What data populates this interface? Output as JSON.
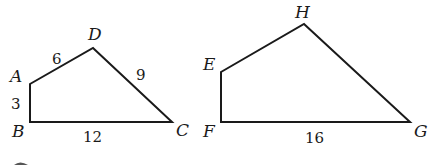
{
  "figures": [
    {
      "name": "quadrilateral-ABCD",
      "vertices": [
        {
          "label": "A",
          "x": 30,
          "y": 84,
          "lx": 10,
          "ly": 82
        },
        {
          "label": "D",
          "x": 93,
          "y": 48,
          "lx": 88,
          "ly": 40
        },
        {
          "label": "C",
          "x": 172,
          "y": 122,
          "lx": 176,
          "ly": 136
        },
        {
          "label": "B",
          "x": 30,
          "y": 122,
          "lx": 12,
          "ly": 137
        }
      ],
      "sides": [
        {
          "name": "AD",
          "label": "6",
          "x": 52,
          "y": 64
        },
        {
          "name": "DC",
          "label": "9",
          "x": 136,
          "y": 80
        },
        {
          "name": "AB",
          "label": "3",
          "x": 11,
          "y": 109
        },
        {
          "name": "BC",
          "label": "12",
          "x": 83,
          "y": 142
        }
      ]
    },
    {
      "name": "quadrilateral-EFGH",
      "vertices": [
        {
          "label": "E",
          "x": 221,
          "y": 72,
          "lx": 203,
          "ly": 70
        },
        {
          "label": "H",
          "x": 304,
          "y": 24,
          "lx": 295,
          "ly": 18
        },
        {
          "label": "G",
          "x": 410,
          "y": 122,
          "lx": 414,
          "ly": 137
        },
        {
          "label": "F",
          "x": 221,
          "y": 122,
          "lx": 203,
          "ly": 137
        }
      ],
      "sides": [
        {
          "name": "FG",
          "label": "16",
          "x": 305,
          "y": 143
        }
      ]
    }
  ]
}
